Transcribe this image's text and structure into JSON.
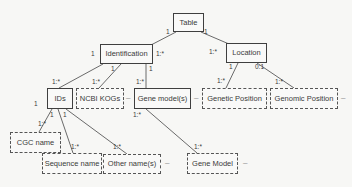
{
  "diagram_type": "schema-tree",
  "colors": {
    "background": "#f7f7f5",
    "box_border_solid": "#3f3f3f",
    "box_border_dashed": "#555555",
    "connector_line": "#6a6a6a",
    "text": "#3a3a3a"
  },
  "nodes": {
    "table": {
      "label": "Table",
      "border": "solid"
    },
    "identification": {
      "label": "Identification",
      "border": "solid"
    },
    "location": {
      "label": "Location",
      "border": "solid"
    },
    "ids": {
      "label": "IDs",
      "border": "solid"
    },
    "ncbi_kogs": {
      "label": "NCBI KOGs",
      "border": "dashed"
    },
    "gene_models": {
      "label": "Gene model(s)",
      "border": "solid"
    },
    "genetic_position": {
      "label": "Genetic Position",
      "border": "dashed"
    },
    "genomic_position": {
      "label": "Genomic Position",
      "border": "dashed"
    },
    "cgc_name": {
      "label": "CGC name",
      "border": "dashed"
    },
    "sequence_name": {
      "label": "Sequence name",
      "border": "dashed"
    },
    "other_names": {
      "label": "Other name(s)",
      "border": "dashed"
    },
    "gene_model": {
      "label": "Gene Model",
      "border": "dashed"
    }
  },
  "multiplicity": {
    "one": "1",
    "one_to_many": "1:*",
    "zero_to_one": "0:1"
  },
  "ellipsis": "–",
  "edges": [
    "Table(1) - Identification(1:*)",
    "Table(1) - Location(1:*)",
    "Identification(1) - IDs(1:*)",
    "Identification(1) - NCBI KOGs(1:*)",
    "Identification(1) - Gene model(s)(1:*)",
    "Location(1) - Genetic Position(1:*)",
    "Location(0:1) - Genomic Position(1:*)",
    "IDs(1) - CGC name(1:*)",
    "IDs(1) - Sequence name(1:*)",
    "IDs(1) - Other name(s)(1:*)",
    "Gene model(s)(1:*) - Gene Model(1:*)"
  ]
}
